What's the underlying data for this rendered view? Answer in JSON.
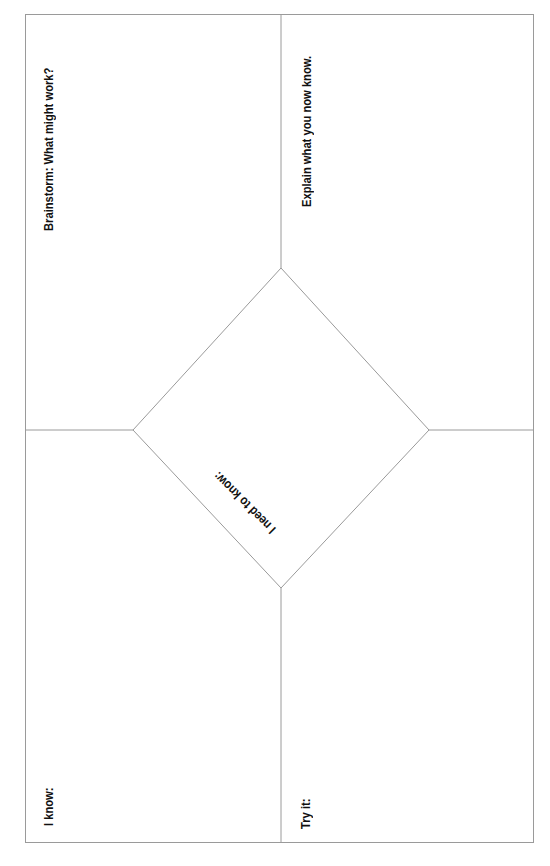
{
  "worksheet": {
    "quadrants": {
      "top_left": {
        "label": "Brainstorm: What might work?"
      },
      "top_right": {
        "label": "Explain what you now know."
      },
      "bottom_left": {
        "label": "I know:"
      },
      "bottom_right": {
        "label": "Try it:"
      },
      "center": {
        "label": "I need to know:"
      }
    },
    "colors": {
      "line": "#9a9a9a",
      "text": "#111111",
      "background": "#ffffff"
    }
  }
}
